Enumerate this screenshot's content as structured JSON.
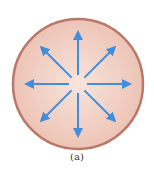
{
  "figure": {
    "caption": "(a)",
    "sphere": {
      "center": [
        78,
        84
      ],
      "radius": 65,
      "border_color": "#b9786a",
      "fill_inner": "#f6ddd3",
      "fill_outer": "#efc8bb"
    },
    "field_lines": {
      "count": 8,
      "direction": "outward",
      "color": "#3f8fdc",
      "inner_radius": 9,
      "outer_radius": 52,
      "angles_deg": [
        0,
        45,
        90,
        135,
        180,
        225,
        270,
        315
      ]
    }
  }
}
